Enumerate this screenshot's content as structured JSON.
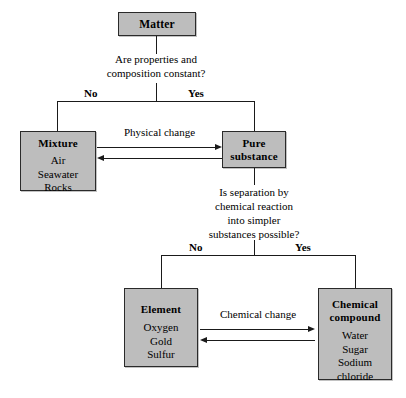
{
  "diagram": {
    "boxes": {
      "matter": {
        "title": "Matter",
        "items": []
      },
      "mixture": {
        "title": "Mixture",
        "items": [
          "Air",
          "Seawater",
          "Rocks"
        ]
      },
      "pure_substance": {
        "title_line1": "Pure",
        "title_line2": "substance",
        "items": []
      },
      "element": {
        "title": "Element",
        "items": [
          "Oxygen",
          "Gold",
          "Sulfur"
        ]
      },
      "chemical_compound": {
        "title_line1": "Chemical",
        "title_line2": "compound",
        "items": [
          "Water",
          "Sugar",
          "Sodium",
          "chloride"
        ]
      }
    },
    "questions": {
      "q1_line1": "Are properties and",
      "q1_line2": "composition constant?",
      "q2_line1": "Is separation by",
      "q2_line2": "chemical reaction",
      "q2_line3": "into simpler",
      "q2_line4": "substances possible?"
    },
    "branch_labels": {
      "q1_no": "No",
      "q1_yes": "Yes",
      "q2_no": "No",
      "q2_yes": "Yes"
    },
    "transitions": {
      "physical_change": "Physical change",
      "chemical_change": "Chemical change"
    },
    "colors": {
      "box_fill": "#bdbdbd",
      "box_border": "#2a2a2a",
      "line": "#1a1a1a",
      "background": "#ffffff",
      "text": "#000000"
    }
  }
}
